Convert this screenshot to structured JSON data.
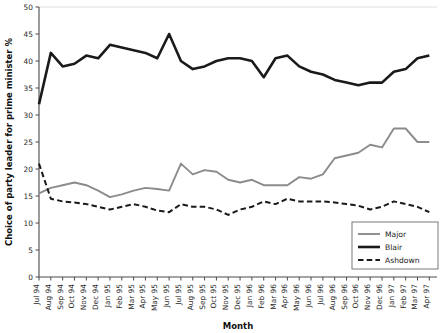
{
  "chart_data": {
    "type": "line",
    "title": "",
    "xlabel": "Month",
    "ylabel": "Choice of party leader for prime minister %",
    "ylim": [
      0,
      50
    ],
    "yticks": [
      0,
      5,
      10,
      15,
      20,
      25,
      30,
      35,
      40,
      45,
      50
    ],
    "grid": false,
    "legend_position": "bottom-right",
    "categories": [
      "Jul 94",
      "Aug 94",
      "Sep 94",
      "Oct 94",
      "Nov 94",
      "Dec 94",
      "Jan 95",
      "Feb 95",
      "Mar 95",
      "Apr 95",
      "May 95",
      "Jun 95",
      "Jul 95",
      "Aug 95",
      "Sep 95",
      "Oct 95",
      "Nov 95",
      "Dec 95",
      "Jan 96",
      "Feb 96",
      "Mar 96",
      "Apr 96",
      "May 96",
      "Jun 96",
      "Jul 96",
      "Aug 96",
      "Sep 96",
      "Oct 96",
      "Nov 96",
      "Dec 96",
      "Jan 97",
      "Feb 97",
      "Mar 97",
      "Apr 97"
    ],
    "series": [
      {
        "name": "Major",
        "color": "#8c8c8c",
        "style": "solid",
        "width": 1.9,
        "values": [
          15.5,
          16.5,
          17.0,
          17.5,
          17.0,
          16.0,
          14.8,
          15.3,
          16.0,
          16.5,
          16.3,
          16.0,
          21.0,
          19.0,
          19.8,
          19.5,
          18.0,
          17.5,
          18.0,
          17.0,
          17.0,
          17.0,
          18.5,
          18.2,
          19.0,
          22.0,
          22.5,
          23.0,
          24.5,
          24.0,
          27.5,
          27.5,
          25.0,
          25.0
        ]
      },
      {
        "name": "Blair",
        "color": "#1a1a1a",
        "style": "solid",
        "width": 2.6,
        "values": [
          32.0,
          41.5,
          39.0,
          39.5,
          41.0,
          40.5,
          43.0,
          42.5,
          42.0,
          41.5,
          40.5,
          45.0,
          40.0,
          38.5,
          39.0,
          40.0,
          40.5,
          40.5,
          40.0,
          37.0,
          40.5,
          41.0,
          39.0,
          38.0,
          37.5,
          36.5,
          36.0,
          35.5,
          36.0,
          36.0,
          38.0,
          38.5,
          40.5,
          41.0
        ]
      },
      {
        "name": "Ashdown",
        "color": "#1a1a1a",
        "style": "dashed",
        "width": 2.0,
        "values": [
          21.0,
          14.5,
          14.0,
          13.8,
          13.5,
          13.0,
          12.5,
          13.0,
          13.5,
          13.0,
          12.3,
          12.0,
          13.5,
          13.0,
          13.0,
          12.5,
          11.5,
          12.5,
          13.0,
          14.0,
          13.5,
          14.5,
          14.0,
          14.0,
          14.0,
          13.8,
          13.5,
          13.2,
          12.5,
          13.0,
          14.0,
          13.5,
          13.0,
          12.0
        ]
      }
    ]
  },
  "legend": {
    "items": [
      {
        "label": "Major"
      },
      {
        "label": "Blair"
      },
      {
        "label": "Ashdown"
      }
    ]
  }
}
